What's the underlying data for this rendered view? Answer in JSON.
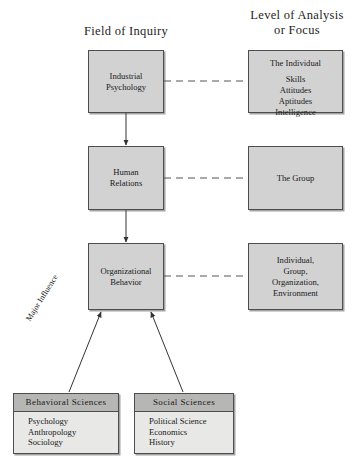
{
  "figure": {
    "headings": {
      "left": "Field of Inquiry",
      "right_line1": "Level of Analysis",
      "right_line2": "or Focus"
    },
    "fields_of_inquiry": [
      {
        "id": "industrial-psychology",
        "line1": "Industrial",
        "line2": "Psychology"
      },
      {
        "id": "human-relations",
        "line1": "Human",
        "line2": "Relations"
      },
      {
        "id": "organizational-behavior",
        "line1": "Organizational",
        "line2": "Behavior"
      }
    ],
    "levels_of_analysis": [
      {
        "id": "the-individual",
        "title": "The Individual",
        "items": [
          "Skills",
          "Attitudes",
          "Aptitudes",
          "Intelligence"
        ]
      },
      {
        "id": "the-group",
        "title": "The Group",
        "items": []
      },
      {
        "id": "individual-group-organization-environment",
        "lines": [
          "Individual,",
          "Group,",
          "Organization,",
          "Environment"
        ]
      }
    ],
    "source_disciplines": [
      {
        "id": "behavioral-sciences",
        "header": "Behavioral Sciences",
        "items": [
          "Psychology",
          "Anthropology",
          "Sociology"
        ]
      },
      {
        "id": "social-sciences",
        "header": "Social Sciences",
        "items": [
          "Political Science",
          "Economics",
          "History"
        ]
      }
    ],
    "annotations": {
      "major_influence": "Major Influence"
    },
    "colors": {
      "box_fill": "#d2d2d2",
      "source_header_fill": "#b6b6b4",
      "source_body_fill": "#e8e8e6",
      "border": "#4d4d4d",
      "background": "#ffffff",
      "text": "#1a1a1a"
    }
  }
}
